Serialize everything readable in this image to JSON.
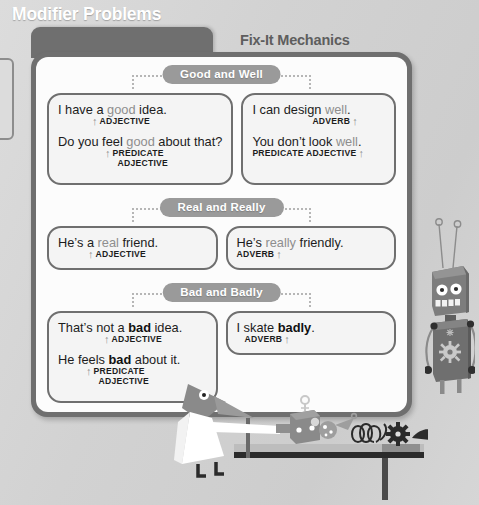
{
  "page": {
    "title": "Modifier Problems",
    "subject": "Fix-It Mechanics",
    "background_color": "#d4d4d4",
    "panel_border_color": "#6f6f6f",
    "panel_fill_color": "#fcfcfc",
    "pill_color": "#9a9a9a",
    "keyword_gray": "#8e8e8e",
    "keyword_dark": "#111111"
  },
  "sections": [
    {
      "heading": "Good and Well",
      "left_box": {
        "examples": [
          {
            "prefix": "I have a ",
            "keyword": "good",
            "keyword_style": "gray",
            "suffix": " idea.",
            "arrow": "↑",
            "arrow_side": "left",
            "label": "ADJECTIVE",
            "label2": ""
          },
          {
            "prefix": "Do you feel ",
            "keyword": "good",
            "keyword_style": "gray",
            "suffix": " about that?",
            "arrow": "↑",
            "arrow_side": "left",
            "label": "PREDICATE",
            "label2": "ADJECTIVE"
          }
        ]
      },
      "right_box": {
        "examples": [
          {
            "prefix": "I can design ",
            "keyword": "well",
            "keyword_style": "gray",
            "suffix": ".",
            "arrow": "↑",
            "arrow_side": "right",
            "label": "ADVERB",
            "label2": ""
          },
          {
            "prefix": "You don’t look ",
            "keyword": "well",
            "keyword_style": "gray",
            "suffix": ".",
            "arrow": "↑",
            "arrow_side": "right",
            "label": "PREDICATE ADJECTIVE",
            "label2": ""
          }
        ]
      }
    },
    {
      "heading": "Real and Really",
      "left_box": {
        "examples": [
          {
            "prefix": "He’s a ",
            "keyword": "real",
            "keyword_style": "gray",
            "suffix": " friend.",
            "arrow": "↑",
            "arrow_side": "left",
            "label": "ADJECTIVE",
            "label2": ""
          }
        ]
      },
      "right_box": {
        "examples": [
          {
            "prefix": "He’s ",
            "keyword": "really",
            "keyword_style": "gray",
            "suffix": " friendly.",
            "arrow": "↑",
            "arrow_side": "right",
            "label": "ADVERB",
            "label2": ""
          }
        ]
      }
    },
    {
      "heading": "Bad and Badly",
      "left_box": {
        "examples": [
          {
            "prefix": "That’s not a ",
            "keyword": "bad",
            "keyword_style": "dark",
            "suffix": " idea.",
            "arrow": "↑",
            "arrow_side": "left",
            "label": "ADJECTIVE",
            "label2": ""
          },
          {
            "prefix": "He feels ",
            "keyword": "bad",
            "keyword_style": "dark",
            "suffix": " about it.",
            "arrow": "↑",
            "arrow_side": "left",
            "label": "PREDICATE",
            "label2": "ADJECTIVE"
          }
        ]
      },
      "right_box": {
        "examples": [
          {
            "prefix": "I skate ",
            "keyword": "badly",
            "keyword_style": "dark",
            "suffix": ".",
            "arrow": "↑",
            "arrow_side": "right",
            "label": "ADVERB",
            "label2": ""
          }
        ]
      }
    }
  ],
  "illustration": {
    "robot": {
      "name": "robot-mascot",
      "body_color": "#6f6f6f",
      "head_color": "#7a7a7a",
      "eye_color": "#ffffff",
      "teeth_count": 4
    },
    "scientist": {
      "name": "bird-scientist",
      "coat_color": "#ffffff",
      "body_color": "#8a8a8a"
    },
    "table": {
      "name": "workbench",
      "top_color": "#b9b9b9",
      "edge_color": "#2b2b2b",
      "objects": [
        "box-with-key",
        "light-bulb",
        "coiled-wire",
        "gear",
        "dark-blade"
      ]
    }
  }
}
